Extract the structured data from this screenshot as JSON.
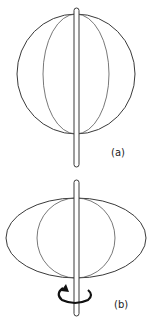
{
  "figure": {
    "panels": [
      {
        "label": "(a)",
        "state": "at rest"
      },
      {
        "label": "(b)",
        "state": "rotating"
      }
    ],
    "colors": {
      "stroke": "#3a3a3a",
      "background": "#ffffff"
    }
  }
}
